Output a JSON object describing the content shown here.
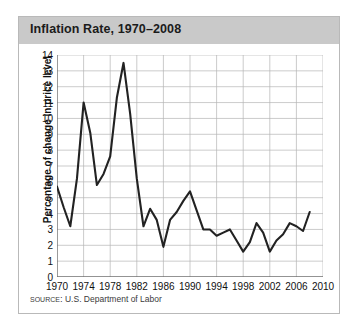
{
  "figure": {
    "title": "Inflation Rate, 1970–2008",
    "source_label": "SOURCE:",
    "source_text": "U.S. Department of Labor"
  },
  "colors": {
    "title_bar": "#c9c9c9",
    "title_text": "#1b1b1b",
    "line": "#222222",
    "grid": "#b5b5b5",
    "axis": "#6f6f6f",
    "panel_border": "#b9b9b9",
    "background": "#ffffff"
  },
  "chart_data": {
    "type": "line",
    "title": "Inflation Rate, 1970–2008",
    "xlabel": "",
    "ylabel": "Percentage of change in price level",
    "xlim": [
      1970,
      2010
    ],
    "ylim": [
      0,
      14
    ],
    "xticks": [
      1970,
      1974,
      1978,
      1982,
      1986,
      1990,
      1994,
      1998,
      2002,
      2006,
      2010
    ],
    "yticks": [
      0,
      1,
      2,
      3,
      4,
      5,
      6,
      7,
      8,
      9,
      10,
      11,
      12,
      13,
      14
    ],
    "grid": true,
    "legend": null,
    "series": [
      {
        "name": "Inflation rate",
        "x": [
          1970,
          1971,
          1972,
          1973,
          1974,
          1975,
          1976,
          1977,
          1978,
          1979,
          1980,
          1981,
          1982,
          1983,
          1984,
          1985,
          1986,
          1987,
          1988,
          1989,
          1990,
          1991,
          1992,
          1993,
          1994,
          1995,
          1996,
          1997,
          1998,
          1999,
          2000,
          2001,
          2002,
          2003,
          2004,
          2005,
          2006,
          2007,
          2008
        ],
        "values": [
          5.7,
          4.4,
          3.2,
          6.2,
          11.0,
          9.1,
          5.8,
          6.5,
          7.6,
          11.3,
          13.5,
          10.3,
          6.2,
          3.2,
          4.3,
          3.6,
          1.9,
          3.6,
          4.1,
          4.8,
          5.4,
          4.2,
          3.0,
          3.0,
          2.6,
          2.8,
          3.0,
          2.3,
          1.6,
          2.2,
          3.4,
          2.8,
          1.6,
          2.3,
          2.7,
          3.4,
          3.2,
          2.9,
          4.1
        ]
      }
    ]
  }
}
